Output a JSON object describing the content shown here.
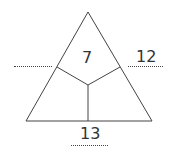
{
  "diagram": {
    "type": "number-triangle",
    "line_color": "#444444",
    "text_color": "#333333",
    "top_value": "7",
    "right_value": "12",
    "bottom_value": "13",
    "left_value": "",
    "blanks": [
      "left",
      "right",
      "bottom"
    ]
  }
}
